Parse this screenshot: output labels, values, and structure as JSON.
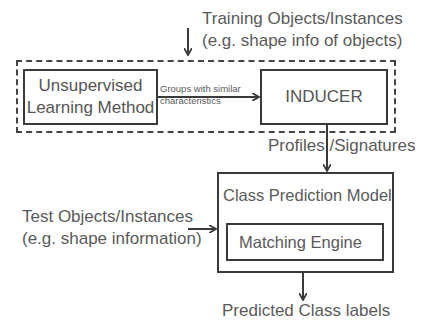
{
  "diagram": {
    "training_input": {
      "line1": "Training Objects/Instances",
      "line2": "(e.g. shape info of objects)"
    },
    "unsupervised_box": {
      "line1": "Unsupervised",
      "line2": "Learning Method"
    },
    "groups_edge": {
      "line1": "Groups with similar",
      "line2": "characteristics"
    },
    "inducer_box": {
      "label": "INDUCER"
    },
    "profiles_edge": {
      "label": "Profiles /Signatures"
    },
    "class_prediction_box": {
      "label": "Class Prediction Model"
    },
    "matching_engine_box": {
      "label": "Matching Engine"
    },
    "test_input": {
      "line1": "Test Objects/Instances",
      "line2": "(e.g. shape information)"
    },
    "output": {
      "label": "Predicted Class labels"
    },
    "colors": {
      "stroke": "#3a3a3a",
      "text": "#5a5a5a",
      "background": "#ffffff"
    }
  }
}
